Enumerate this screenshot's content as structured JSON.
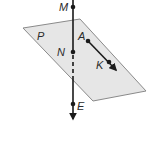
{
  "diagram": {
    "plane": {
      "label": "P",
      "fill": "#e6e6e6",
      "stroke": "#8a8a8a",
      "corners": [
        [
          23,
          28
        ],
        [
          80,
          19
        ],
        [
          146,
          91
        ],
        [
          93,
          101
        ]
      ]
    },
    "vertical_line": {
      "x": 73,
      "top_y": 0,
      "bottom_arrow_y": 121,
      "dashed_from_y": 53,
      "dashed_to_y": 80,
      "color": "#1a1a1a"
    },
    "points": [
      {
        "name": "M",
        "x": 73,
        "y": 7,
        "label_x": 59,
        "label_y": 11
      },
      {
        "name": "N",
        "x": 73,
        "y": 52,
        "label_x": 57,
        "label_y": 56
      },
      {
        "name": "E",
        "x": 73,
        "y": 104,
        "label_x": 77,
        "label_y": 110
      },
      {
        "name": "A",
        "x": 88,
        "y": 41,
        "label_x": 78,
        "label_y": 40
      },
      {
        "name": "K",
        "x": 109,
        "y": 62,
        "label_x": 96,
        "label_y": 69
      }
    ],
    "ray_AK": {
      "from": [
        88,
        41
      ],
      "to": [
        118,
        72
      ]
    }
  }
}
